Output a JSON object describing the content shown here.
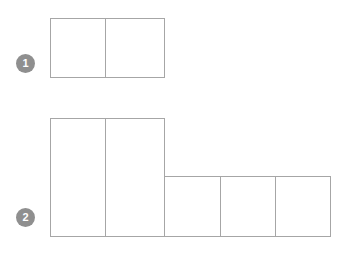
{
  "diagram": {
    "background_color": "#ffffff",
    "line_color": "#a6a6a6",
    "badge_color": "#8f8f8f",
    "badge_text_color": "#ffffff"
  },
  "rows": [
    {
      "badge_label": "1",
      "badge_name": "row-1-number-badge",
      "bars": [
        {
          "name": "row-1-bar",
          "segments": 2,
          "segment_labels": [
            "",
            ""
          ]
        }
      ]
    },
    {
      "badge_label": "2",
      "badge_name": "row-2-number-badge",
      "bars": [
        {
          "name": "row-2-tall-bar",
          "segments": 2,
          "segment_labels": [
            "",
            ""
          ]
        },
        {
          "name": "row-2-short-bar",
          "segments": 3,
          "segment_labels": [
            "",
            "",
            ""
          ]
        }
      ]
    }
  ],
  "chart_data": {
    "type": "bar",
    "title": "",
    "xlabel": "",
    "ylabel": "",
    "categories": [
      "1",
      "2"
    ],
    "series": [
      {
        "name": "tall-bar-segments",
        "values": [
          2,
          2
        ]
      },
      {
        "name": "short-bar-segments",
        "values": [
          0,
          3
        ]
      }
    ],
    "grid": false,
    "legend": "none"
  }
}
